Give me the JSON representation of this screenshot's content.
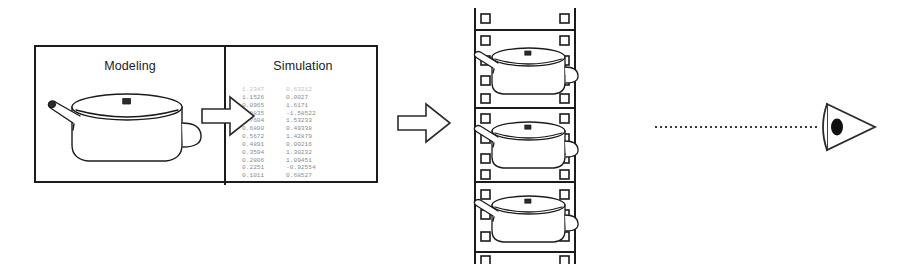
{
  "figure": {
    "background_color": "#ffffff",
    "ink_color": "#1b1b1b"
  },
  "pipeline_box": {
    "panels": [
      {
        "id": "modeling",
        "title": "Modeling",
        "content_icon": "saucepan-icon"
      },
      {
        "id": "simulation",
        "title": "Simulation",
        "content_icon": "numeric-data-table"
      }
    ]
  },
  "simulation_data": {
    "columns": [
      "value_a",
      "value_b"
    ],
    "rows": [
      [
        "1.2347",
        "0.63212"
      ],
      [
        "1.1526",
        "0.0027"
      ],
      [
        "0.0965",
        "1.6171"
      ],
      [
        "0.8835",
        "-1.58522"
      ],
      [
        "0.7604",
        "1.53233"
      ],
      [
        "0.6800",
        "0.49338"
      ],
      [
        "0.5672",
        "1.42879"
      ],
      [
        "0.4891",
        "0.00216"
      ],
      [
        "0.3594",
        "1.30232"
      ],
      [
        "0.2806",
        "1.09451"
      ],
      [
        "0.2251",
        "-0.92554"
      ],
      [
        "0.1011",
        "0.68527"
      ]
    ]
  },
  "arrows": [
    {
      "id": "arrow-modeling-to-simulation",
      "direction": "right",
      "style": "outlined-block-arrow"
    },
    {
      "id": "arrow-simulation-to-film",
      "direction": "right",
      "style": "outlined-block-arrow"
    }
  ],
  "filmstrip": {
    "frame_count": 3,
    "frame_icon": "saucepan-icon",
    "sprocket_shape": "square",
    "sprockets_per_side": 13
  },
  "sight_line": {
    "style": "dotted",
    "direction": "right-to-left"
  },
  "viewer": {
    "icon": "eye-icon",
    "label": "viewer"
  }
}
